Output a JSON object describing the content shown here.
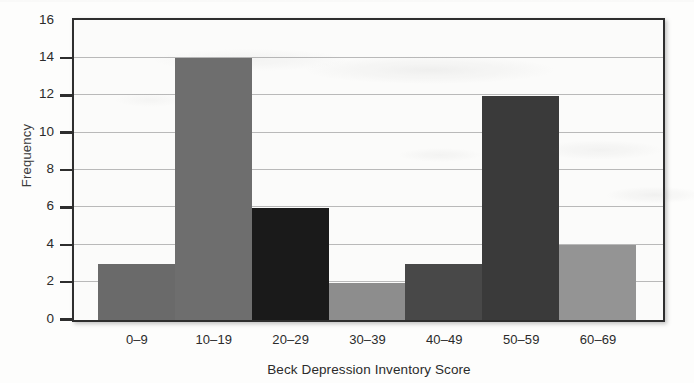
{
  "chart_data": {
    "type": "bar",
    "title": "",
    "xlabel": "Beck Depression Inventory Score",
    "ylabel": "Frequency",
    "categories": [
      "0–9",
      "10–19",
      "20–29",
      "30–39",
      "40–49",
      "50–59",
      "60–69"
    ],
    "values": [
      3,
      14,
      6,
      2,
      3,
      12,
      4
    ],
    "bar_colors": [
      "#6a6a6a",
      "#6e6e6e",
      "#1a1a1a",
      "#8d8d8d",
      "#484848",
      "#3a3a3a",
      "#949494"
    ],
    "ylim": [
      0,
      16
    ],
    "ytick_labels": [
      "0",
      "2",
      "4",
      "6",
      "8",
      "10",
      "12",
      "14",
      "16"
    ],
    "ytick_values": [
      0,
      2,
      4,
      6,
      8,
      10,
      12,
      14,
      16
    ],
    "grid": true,
    "grid_axis": "y",
    "legend": false,
    "legend_position": "none",
    "frame_color": "#2e2e2e",
    "plot_background": "#fbfbfa",
    "gridline_color": "#b9b9b9",
    "bars": [
      {
        "category": "0–9",
        "value": 3,
        "color": "#6a6a6a"
      },
      {
        "category": "10–19",
        "value": 14,
        "color": "#6e6e6e"
      },
      {
        "category": "20–29",
        "value": 6,
        "color": "#1a1a1a"
      },
      {
        "category": "30–39",
        "value": 2,
        "color": "#8d8d8d"
      },
      {
        "category": "40–49",
        "value": 3,
        "color": "#484848"
      },
      {
        "category": "50–59",
        "value": 12,
        "color": "#3a3a3a"
      },
      {
        "category": "60–69",
        "value": 4,
        "color": "#949494"
      }
    ]
  }
}
